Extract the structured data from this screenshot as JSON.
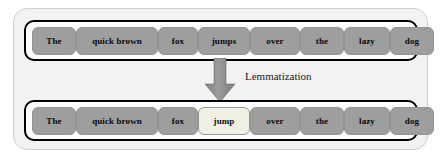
{
  "diagram": {
    "title": "Lemmatization",
    "caption": "Lemmatization",
    "arrow_icon": "down-arrow-icon",
    "colors": {
      "panel_background": "#f2f2f2",
      "panel_border": "#cfcfcf",
      "row_background": "#ffffff",
      "row_border": "#000000",
      "chip_background": "#9e9e9e",
      "chip_border": "#949494",
      "chip_text": "#0a0a0a",
      "highlight_background": "#f1f0e4",
      "highlight_border": "#9a9a9a",
      "arrow_fill": "#8c8c8c",
      "caption_text": "#1a1a1a"
    }
  },
  "input_row": {
    "label": "input-sentence",
    "tokens": [
      {
        "text": "The",
        "highlighted": false
      },
      {
        "text": "quick brown",
        "highlighted": false
      },
      {
        "text": "fox",
        "highlighted": false
      },
      {
        "text": "jumps",
        "highlighted": false
      },
      {
        "text": "over",
        "highlighted": false
      },
      {
        "text": "the",
        "highlighted": false
      },
      {
        "text": "lazy",
        "highlighted": false
      },
      {
        "text": "dog",
        "highlighted": false
      }
    ]
  },
  "output_row": {
    "label": "lemmatized-sentence",
    "tokens": [
      {
        "text": "The",
        "highlighted": false
      },
      {
        "text": "quick brown",
        "highlighted": false
      },
      {
        "text": "fox",
        "highlighted": false
      },
      {
        "text": "jump",
        "highlighted": true
      },
      {
        "text": "over",
        "highlighted": false
      },
      {
        "text": "the",
        "highlighted": false
      },
      {
        "text": "lazy",
        "highlighted": false
      },
      {
        "text": "dog",
        "highlighted": false
      }
    ]
  }
}
